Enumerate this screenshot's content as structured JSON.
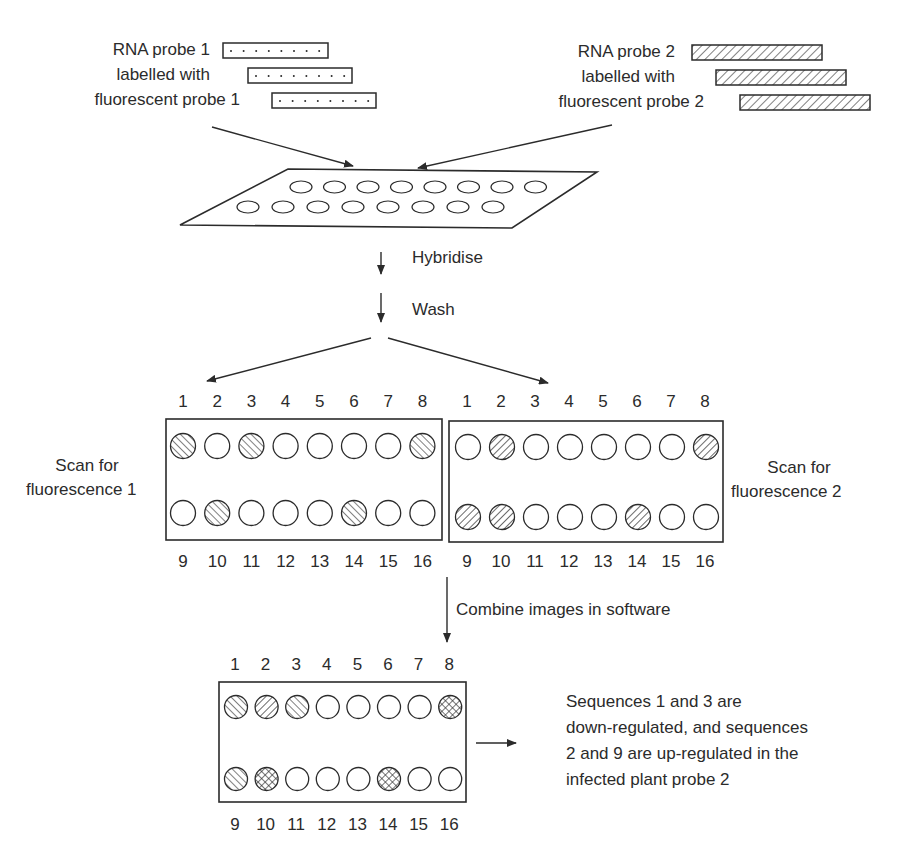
{
  "header_fragment": "ybridisation",
  "probe1": {
    "lines": [
      "RNA probe 1",
      "labelled with",
      "fluorescent probe 1"
    ],
    "pattern": "dotted"
  },
  "probe2": {
    "lines": [
      "RNA probe 2",
      "labelled with",
      "fluorescent probe 2"
    ],
    "pattern": "hatched"
  },
  "steps": {
    "hybridise": "Hybridise",
    "wash": "Wash",
    "combine": "Combine images in software"
  },
  "scan1": {
    "label_line1": "Scan for",
    "label_line2": "fluorescence 1",
    "top_numbers": [
      "1",
      "2",
      "3",
      "4",
      "5",
      "6",
      "7",
      "8"
    ],
    "bottom_numbers": [
      "9",
      "10",
      "11",
      "12",
      "13",
      "14",
      "15",
      "16"
    ],
    "row1": [
      "hatch1",
      "empty",
      "hatch1",
      "empty",
      "empty",
      "empty",
      "empty",
      "hatch1"
    ],
    "row2": [
      "empty",
      "hatch1",
      "empty",
      "empty",
      "empty",
      "hatch1",
      "empty",
      "empty"
    ]
  },
  "scan2": {
    "label_line1": "Scan for",
    "label_line2": "fluorescence 2",
    "top_numbers": [
      "1",
      "2",
      "3",
      "4",
      "5",
      "6",
      "7",
      "8"
    ],
    "bottom_numbers": [
      "9",
      "10",
      "11",
      "12",
      "13",
      "14",
      "15",
      "16"
    ],
    "row1": [
      "empty",
      "hatch2",
      "empty",
      "empty",
      "empty",
      "empty",
      "empty",
      "hatch2"
    ],
    "row2": [
      "hatch2",
      "hatch2",
      "empty",
      "empty",
      "empty",
      "hatch2",
      "empty",
      "empty"
    ]
  },
  "combined": {
    "top_numbers": [
      "1",
      "2",
      "3",
      "4",
      "5",
      "6",
      "7",
      "8"
    ],
    "bottom_numbers": [
      "9",
      "10",
      "11",
      "12",
      "13",
      "14",
      "15",
      "16"
    ],
    "row1": [
      "hatch1",
      "hatch2",
      "hatch1",
      "empty",
      "empty",
      "empty",
      "empty",
      "cross"
    ],
    "row2": [
      "hatch1",
      "cross",
      "empty",
      "empty",
      "empty",
      "cross",
      "empty",
      "empty"
    ]
  },
  "conclusion": {
    "lines": [
      "Sequences 1 and 3 are",
      "down-regulated, and sequences",
      "2 and 9 are up-regulated in the",
      "infected plant probe 2"
    ]
  },
  "colors": {
    "ink": "#2b2b2b",
    "background": "#ffffff"
  }
}
